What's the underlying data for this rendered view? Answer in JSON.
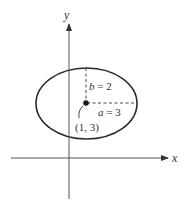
{
  "diagram": {
    "axes": {
      "x_label": "x",
      "y_label": "y"
    },
    "ellipse": {
      "center": "(1, 3)",
      "a": 3,
      "b": 2
    },
    "labels": {
      "b_text": "b = 2",
      "a_text": "a = 3",
      "center_text": "(1, 3)"
    },
    "colors": {
      "stroke": "#2a2a2a",
      "dashed": "#444444"
    }
  }
}
